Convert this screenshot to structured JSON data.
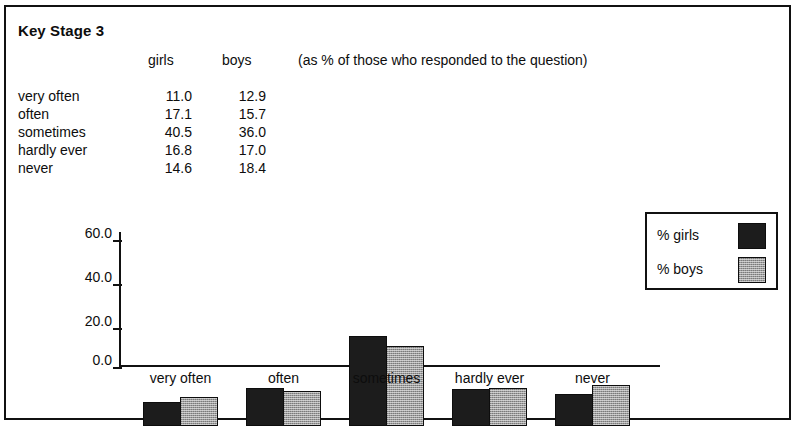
{
  "document": {
    "title": "Key Stage 3",
    "note": "(as % of those who responded to the question)"
  },
  "table": {
    "columns": [
      "",
      "girls",
      "boys"
    ],
    "rows": [
      {
        "label": "very often",
        "girls": "11.0",
        "boys": "12.9"
      },
      {
        "label": "often",
        "girls": "17.1",
        "boys": "15.7"
      },
      {
        "label": "sometimes",
        "girls": "40.5",
        "boys": "36.0"
      },
      {
        "label": "hardly ever",
        "girls": "16.8",
        "boys": "17.0"
      },
      {
        "label": "never",
        "girls": "14.6",
        "boys": "18.4"
      }
    ]
  },
  "legend": {
    "entries": [
      {
        "label": "% girls",
        "swatch": "girls",
        "color": "#1c1c1c"
      },
      {
        "label": "% boys",
        "swatch": "boys",
        "color": "#9c9c9c"
      }
    ]
  },
  "chart_data": {
    "type": "bar",
    "title": "Key Stage 3",
    "subtitle": "(as % of those who responded to the question)",
    "categories": [
      "very often",
      "often",
      "sometimes",
      "hardly ever",
      "never"
    ],
    "series": [
      {
        "name": "% girls",
        "values": [
          11.0,
          17.1,
          40.5,
          16.8,
          14.6
        ],
        "color": "#1c1c1c"
      },
      {
        "name": "% boys",
        "values": [
          12.9,
          15.7,
          36.0,
          17.0,
          18.4
        ],
        "color": "#9c9c9c"
      }
    ],
    "xlabel": "",
    "ylabel": "",
    "ylim": [
      0,
      60
    ],
    "yticks": [
      "0.0",
      "20.0",
      "40.0",
      "60.0"
    ],
    "ytick_values": [
      0,
      20,
      40,
      60
    ],
    "grid": false,
    "legend_position": "right"
  }
}
